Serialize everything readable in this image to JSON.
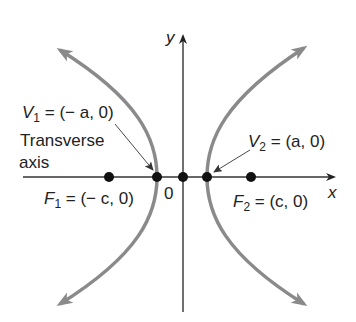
{
  "diagram": {
    "type": "hyperbola-transverse-axis",
    "colors": {
      "curve": "#8a8a8a",
      "axis": "#333333",
      "point": "#111111",
      "text": "#222222",
      "background": "#ffffff"
    },
    "axes": {
      "x_label": "x",
      "y_label": "y",
      "origin_label": "0"
    },
    "labels": {
      "v1": {
        "name": "V",
        "sub": "1",
        "rest": " = (− a, 0)"
      },
      "v2": {
        "name": "V",
        "sub": "2",
        "rest": " = (a, 0)"
      },
      "f1": {
        "name": "F",
        "sub": "1",
        "rest": " = (− c, 0)"
      },
      "f2": {
        "name": "F",
        "sub": "2",
        "rest": " = (c, 0)"
      },
      "transverse_line1": "Transverse",
      "transverse_line2": "axis"
    },
    "points": [
      {
        "id": "F1",
        "x": -1
      },
      {
        "id": "V1",
        "x": -0.5
      },
      {
        "id": "O",
        "x": 0
      },
      {
        "id": "V2",
        "x": 0.5
      },
      {
        "id": "F2",
        "x": 1
      }
    ]
  }
}
